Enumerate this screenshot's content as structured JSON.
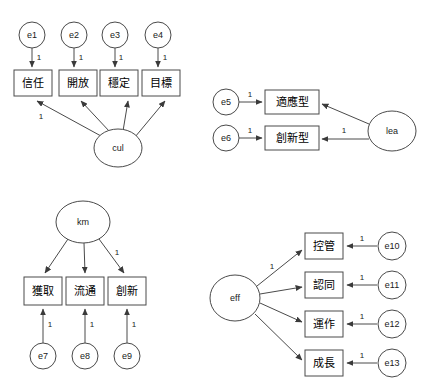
{
  "diagram": {
    "type": "sem-path-diagram",
    "title": "",
    "background_color": "#ffffff",
    "stroke_color": "#4a4a4a",
    "text_color": "#000000",
    "panels": [
      {
        "id": "panel-cul",
        "latent": {
          "name": "cul",
          "shape": "ellipse",
          "cx": 118,
          "cy": 148,
          "rx": 24,
          "ry": 19
        },
        "indicators": [
          {
            "name": "信任",
            "shape": "rect",
            "x": 14,
            "y": 70,
            "w": 38,
            "h": 26
          },
          {
            "name": "開放",
            "shape": "rect",
            "x": 62,
            "y": 70,
            "w": 38,
            "h": 26
          },
          {
            "name": "穩定",
            "shape": "rect",
            "x": 100,
            "y": 70,
            "w": 38,
            "h": 26
          },
          {
            "name": "目標",
            "shape": "rect",
            "x": 142,
            "y": 70,
            "w": 38,
            "h": 26
          }
        ],
        "errors": [
          {
            "name": "e1",
            "shape": "circle",
            "cx": 32,
            "cy": 35,
            "r": 13
          },
          {
            "name": "e2",
            "shape": "circle",
            "cx": 74,
            "cy": 35,
            "r": 13
          },
          {
            "name": "e3",
            "shape": "circle",
            "cx": 115,
            "cy": 35,
            "r": 13
          },
          {
            "name": "e4",
            "shape": "circle",
            "cx": 158,
            "cy": 35,
            "r": 13
          }
        ],
        "error_weights": [
          "1",
          "1",
          "1",
          "1"
        ],
        "loading_weights": [
          "1",
          "",
          "",
          ""
        ]
      },
      {
        "id": "panel-lea",
        "latent": {
          "name": "lea",
          "shape": "ellipse",
          "cx": 392,
          "cy": 131,
          "rx": 24,
          "ry": 20
        },
        "indicators": [
          {
            "name": "適應型",
            "shape": "rect",
            "x": 265,
            "y": 90,
            "w": 54,
            "h": 24
          },
          {
            "name": "創新型",
            "shape": "rect",
            "x": 265,
            "y": 126,
            "w": 54,
            "h": 24
          }
        ],
        "errors": [
          {
            "name": "e5",
            "shape": "circle",
            "cx": 226,
            "cy": 102,
            "r": 13
          },
          {
            "name": "e6",
            "shape": "circle",
            "cx": 226,
            "cy": 138,
            "r": 13
          }
        ],
        "error_weights": [
          "1",
          "1"
        ],
        "loading_weights": [
          "",
          "1"
        ]
      },
      {
        "id": "panel-km",
        "latent": {
          "name": "km",
          "shape": "ellipse",
          "cx": 83,
          "cy": 222,
          "rx": 27,
          "ry": 21
        },
        "indicators": [
          {
            "name": "獲取",
            "shape": "rect",
            "x": 24,
            "y": 277,
            "w": 38,
            "h": 28
          },
          {
            "name": "流通",
            "shape": "rect",
            "x": 66,
            "y": 277,
            "w": 38,
            "h": 28
          },
          {
            "name": "創新",
            "shape": "rect",
            "x": 108,
            "y": 277,
            "w": 38,
            "h": 28
          }
        ],
        "errors": [
          {
            "name": "e7",
            "shape": "circle",
            "cx": 43,
            "cy": 356,
            "r": 13
          },
          {
            "name": "e8",
            "shape": "circle",
            "cx": 85,
            "cy": 356,
            "r": 13
          },
          {
            "name": "e9",
            "shape": "circle",
            "cx": 127,
            "cy": 356,
            "r": 13
          }
        ],
        "error_weights": [
          "1",
          "1",
          "1"
        ],
        "loading_weights": [
          "",
          "",
          "1"
        ]
      },
      {
        "id": "panel-eff",
        "latent": {
          "name": "eff",
          "shape": "ellipse",
          "cx": 235,
          "cy": 298,
          "rx": 25,
          "ry": 23
        },
        "indicators": [
          {
            "name": "控管",
            "shape": "rect",
            "x": 305,
            "y": 233,
            "w": 38,
            "h": 26
          },
          {
            "name": "認同",
            "shape": "rect",
            "x": 305,
            "y": 272,
            "w": 38,
            "h": 26
          },
          {
            "name": "運作",
            "shape": "rect",
            "x": 305,
            "y": 311,
            "w": 38,
            "h": 26
          },
          {
            "name": "成長",
            "shape": "rect",
            "x": 305,
            "y": 350,
            "w": 38,
            "h": 26
          }
        ],
        "errors": [
          {
            "name": "e10",
            "shape": "circle",
            "cx": 392,
            "cy": 246,
            "r": 14
          },
          {
            "name": "e11",
            "shape": "circle",
            "cx": 392,
            "cy": 285,
            "r": 14
          },
          {
            "name": "e12",
            "shape": "circle",
            "cx": 392,
            "cy": 324,
            "r": 14
          },
          {
            "name": "e13",
            "shape": "circle",
            "cx": 392,
            "cy": 363,
            "r": 14
          }
        ],
        "error_weights": [
          "1",
          "1",
          "1",
          "1"
        ],
        "loading_weights": [
          "1",
          "",
          "",
          ""
        ]
      }
    ]
  }
}
